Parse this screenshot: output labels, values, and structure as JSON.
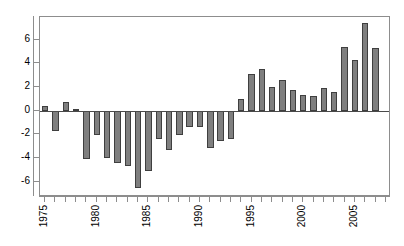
{
  "chart_data": {
    "type": "bar",
    "title": "",
    "subtitle": "",
    "xlabel": "",
    "ylabel": "",
    "grid": false,
    "legend": null,
    "categories": [
      "1975",
      "1976",
      "1977",
      "1978",
      "1979",
      "1980",
      "1981",
      "1982",
      "1983",
      "1984",
      "1985",
      "1986",
      "1987",
      "1988",
      "1989",
      "1990",
      "1991",
      "1992",
      "1993",
      "1994",
      "1995",
      "1996",
      "1997",
      "1998",
      "1999",
      "2000",
      "2001",
      "2002",
      "2003",
      "2004",
      "2005",
      "2006",
      "2007",
      "2008"
    ],
    "values": [
      0.4,
      -1.7,
      0.75,
      0.1,
      -4.1,
      -2.1,
      -4.0,
      -4.4,
      -4.7,
      -6.5,
      -5.1,
      -2.4,
      -3.3,
      -2.1,
      -1.4,
      -1.35,
      -3.2,
      -2.6,
      -2.4,
      0.95,
      3.1,
      3.55,
      1.95,
      2.55,
      1.75,
      1.35,
      1.25,
      1.9,
      1.55,
      5.35,
      4.25,
      7.4,
      5.25,
      null
    ],
    "ylim": [
      -7.3,
      7.9
    ],
    "yticks": [
      6,
      4,
      2,
      0,
      -2,
      -4,
      -6
    ],
    "ytick_labels": [
      "6",
      "4",
      "2",
      "0",
      "-2",
      "-4",
      "-6"
    ],
    "xticks": [
      "1975",
      "1976",
      "1977",
      "1978",
      "1979",
      "1980",
      "1981",
      "1982",
      "1983",
      "1984",
      "1985",
      "1986",
      "1987",
      "1988",
      "1989",
      "1990",
      "1991",
      "1992",
      "1993",
      "1994",
      "1995",
      "1996",
      "1997",
      "1998",
      "1999",
      "2000",
      "2001",
      "2002",
      "2003",
      "2004",
      "2005",
      "2006",
      "2007",
      "2008"
    ],
    "xtick_labels_shown": [
      "1975",
      "1980",
      "1985",
      "1990",
      "1995",
      "2000",
      "2005"
    ],
    "bar_fill_color": "#7f7f7f",
    "bar_border_color": "#3f3f3f",
    "axis_color": "#8d8d8d",
    "baseline_color": "#4a4a4a",
    "background_color": "#ffffff"
  }
}
